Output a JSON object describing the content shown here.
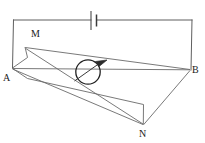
{
  "figure": {
    "width": 205,
    "height": 143,
    "background_color": "#ffffff",
    "stroke_color": "#5a5a5a",
    "dark_stroke_color": "#262626",
    "label_color": "#1a1a1a"
  },
  "labels": {
    "a": "A",
    "b": "B",
    "m": "M",
    "n": "N"
  },
  "components": {
    "battery": {
      "name": "battery-cell",
      "long_plate_x": 91,
      "short_plate_x": 97,
      "center_y": 20
    },
    "coil": {
      "name": "rotating-coil",
      "center_x": 88,
      "center_y": 72,
      "radius": 12,
      "arrow_label": "rotation-direction"
    },
    "circuit_wire": {
      "top_y": 20,
      "left_x": 13,
      "right_x": 192
    }
  },
  "geometry": {
    "points": {
      "A": [
        12,
        68
      ],
      "B": [
        190,
        70
      ],
      "M": [
        25,
        48
      ],
      "N": [
        143,
        125
      ],
      "frame_back_left": [
        27,
        78
      ],
      "frame_back_right": [
        143,
        105
      ],
      "frame_low_left": [
        12,
        68
      ],
      "inner_mid": [
        70,
        58
      ]
    }
  }
}
